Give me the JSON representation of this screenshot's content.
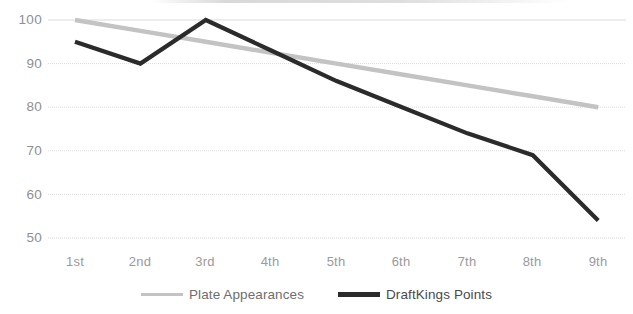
{
  "chart_data": {
    "type": "line",
    "title": "",
    "xlabel": "",
    "ylabel": "",
    "categories": [
      "1st",
      "2nd",
      "3rd",
      "4th",
      "5th",
      "6th",
      "7th",
      "8th",
      "9th"
    ],
    "series": [
      {
        "name": "Plate Appearances",
        "color": "#c3c3c3",
        "values": [
          100,
          97.5,
          95,
          92.5,
          90,
          87.5,
          85,
          82.5,
          80
        ]
      },
      {
        "name": "DraftKings Points",
        "color": "#2b2b2b",
        "values": [
          95,
          90,
          100,
          93,
          86,
          80,
          74,
          69,
          54
        ]
      }
    ],
    "ylim": [
      50,
      100
    ],
    "yticks": [
      50,
      60,
      70,
      80,
      90,
      100
    ],
    "ytick_labels": [
      "50",
      "60",
      "70",
      "80",
      "90",
      "100"
    ],
    "grid": true,
    "grid_color": "#d9d9d9",
    "legend_position": "bottom",
    "background": "#ffffff"
  },
  "legend": {
    "items": [
      {
        "label": "Plate Appearances"
      },
      {
        "label": "DraftKings Points"
      }
    ]
  }
}
